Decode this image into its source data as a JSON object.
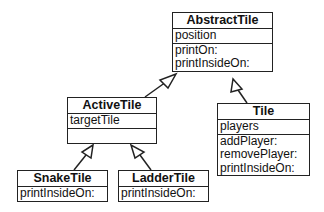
{
  "classes": {
    "abstract_tile": {
      "name": "AbstractTile",
      "attributes": [
        "position"
      ],
      "methods": [
        "printOn:",
        "printInsideOn:"
      ]
    },
    "active_tile": {
      "name": "ActiveTile",
      "attributes": [
        "targetTile"
      ],
      "methods": []
    },
    "tile": {
      "name": "Tile",
      "attributes": [
        "players"
      ],
      "methods": [
        "addPlayer:",
        "removePlayer:",
        "printInsideOn:"
      ]
    },
    "snake_tile": {
      "name": "SnakeTile",
      "attributes": [],
      "methods": [
        "printInsideOn:"
      ]
    },
    "ladder_tile": {
      "name": "LadderTile",
      "attributes": [],
      "methods": [
        "printInsideOn:"
      ]
    }
  },
  "relations": [
    {
      "from": "ActiveTile",
      "to": "AbstractTile",
      "type": "inheritance"
    },
    {
      "from": "Tile",
      "to": "AbstractTile",
      "type": "inheritance"
    },
    {
      "from": "SnakeTile",
      "to": "ActiveTile",
      "type": "inheritance"
    },
    {
      "from": "LadderTile",
      "to": "ActiveTile",
      "type": "inheritance"
    }
  ]
}
